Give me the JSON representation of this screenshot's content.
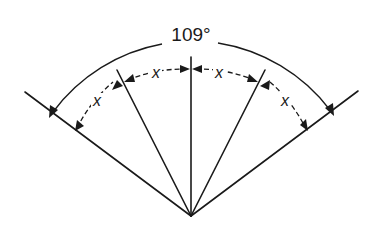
{
  "diagram": {
    "total_angle_label": "109°",
    "segment_label": "x",
    "segment_count": 4,
    "segment_labels": [
      "x",
      "x",
      "x",
      "x"
    ],
    "apex": [
      191,
      216
    ],
    "rays": [
      {
        "name": "outer-left-ray",
        "angle_from_vertical_deg": -54.5
      },
      {
        "name": "inner-left-ray",
        "angle_from_vertical_deg": -27.25
      },
      {
        "name": "center-ray",
        "angle_from_vertical_deg": 0
      },
      {
        "name": "inner-right-ray",
        "angle_from_vertical_deg": 27.25
      },
      {
        "name": "outer-right-ray",
        "angle_from_vertical_deg": 54.5
      }
    ],
    "colors": {
      "line": "#1a1a1a",
      "background": "#ffffff"
    }
  }
}
